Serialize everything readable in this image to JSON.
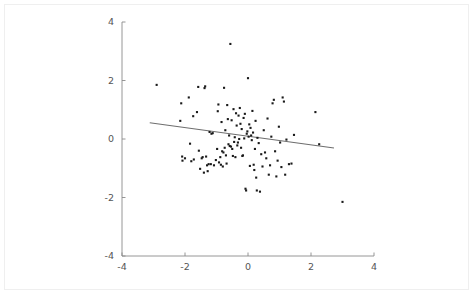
{
  "chart_data": {
    "type": "scatter",
    "title": "",
    "subtitle": "",
    "xlabel": "",
    "ylabel": "",
    "xlim": [
      -4,
      4
    ],
    "ylim": [
      -4,
      4
    ],
    "xticks": [
      -4,
      -2,
      0,
      2,
      4
    ],
    "yticks": [
      -4,
      -2,
      0,
      2,
      4
    ],
    "xtick_labels": [
      "-4",
      "-2",
      "0",
      "2",
      "4"
    ],
    "ytick_labels": [
      "-4",
      "-2",
      "0",
      "2",
      "4"
    ],
    "grid": false,
    "legend": null,
    "legend_position": "none",
    "marker": "square",
    "marker_size": 2.1,
    "point_color": "#1a1a1a",
    "line_color": "#6e6e6e",
    "axis_color": "#8a8a8a",
    "background_color": "#ffffff",
    "border_color": "#efefef",
    "annotations": [],
    "trendline": {
      "type": "linear-fit",
      "slope": -0.147,
      "intercept": 0.095,
      "x_start": -3.12,
      "y_start": 0.553,
      "x_end": 2.73,
      "y_end": -0.306
    },
    "n_points": 122,
    "points": [
      [
        -2.9,
        1.85
      ],
      [
        -2.12,
        1.22
      ],
      [
        -2.15,
        0.62
      ],
      [
        -2.09,
        -0.6
      ],
      [
        -2.08,
        -0.74
      ],
      [
        -2.0,
        -0.66
      ],
      [
        -1.88,
        1.42
      ],
      [
        -1.84,
        -0.16
      ],
      [
        -1.8,
        -0.76
      ],
      [
        -1.74,
        0.78
      ],
      [
        -1.72,
        -0.7
      ],
      [
        -1.62,
        0.92
      ],
      [
        -1.58,
        1.78
      ],
      [
        -1.56,
        -0.4
      ],
      [
        -1.52,
        -1.02
      ],
      [
        -1.47,
        -0.66
      ],
      [
        -1.44,
        -0.62
      ],
      [
        -1.4,
        -1.15
      ],
      [
        -1.38,
        1.74
      ],
      [
        -1.36,
        1.8
      ],
      [
        -1.33,
        -0.6
      ],
      [
        -1.3,
        -0.9
      ],
      [
        -1.28,
        -1.1
      ],
      [
        -1.25,
        -0.86
      ],
      [
        -1.22,
        0.24
      ],
      [
        -1.18,
        -0.86
      ],
      [
        -1.16,
        0.18
      ],
      [
        -1.12,
        0.2
      ],
      [
        -1.08,
        -0.9
      ],
      [
        -1.02,
        -0.72
      ],
      [
        -0.98,
        -0.34
      ],
      [
        -0.96,
        0.95
      ],
      [
        -0.94,
        1.18
      ],
      [
        -0.92,
        -0.8
      ],
      [
        -0.88,
        -0.62
      ],
      [
        -0.86,
        -0.88
      ],
      [
        -0.84,
        0.58
      ],
      [
        -0.82,
        -0.42
      ],
      [
        -0.8,
        -0.94
      ],
      [
        -0.78,
        -0.46
      ],
      [
        -0.76,
        1.75
      ],
      [
        -0.74,
        -0.3
      ],
      [
        -0.72,
        0.3
      ],
      [
        -0.7,
        -0.56
      ],
      [
        -0.68,
        -0.84
      ],
      [
        -0.66,
        1.16
      ],
      [
        -0.64,
        0.68
      ],
      [
        -0.62,
        -0.18
      ],
      [
        -0.6,
        0.12
      ],
      [
        -0.58,
        -0.24
      ],
      [
        -0.56,
        3.25
      ],
      [
        -0.54,
        -0.26
      ],
      [
        -0.52,
        0.64
      ],
      [
        -0.5,
        -0.34
      ],
      [
        -0.48,
        -0.58
      ],
      [
        -0.46,
        1.02
      ],
      [
        -0.44,
        -0.1
      ],
      [
        -0.42,
        0.06
      ],
      [
        -0.4,
        -0.62
      ],
      [
        -0.38,
        0.88
      ],
      [
        -0.36,
        0.46
      ],
      [
        -0.34,
        -0.22
      ],
      [
        -0.32,
        -0.12
      ],
      [
        -0.3,
        0.8
      ],
      [
        -0.28,
        0.0
      ],
      [
        -0.26,
        1.06
      ],
      [
        -0.24,
        0.52
      ],
      [
        -0.22,
        -0.3
      ],
      [
        -0.2,
        0.34
      ],
      [
        -0.18,
        -0.58
      ],
      [
        -0.16,
        -0.56
      ],
      [
        -0.14,
        0.72
      ],
      [
        -0.12,
        0.02
      ],
      [
        -0.1,
        0.86
      ],
      [
        -0.08,
        -1.7
      ],
      [
        -0.06,
        -1.76
      ],
      [
        -0.04,
        0.18
      ],
      [
        -0.02,
        0.26
      ],
      [
        0.0,
        2.08
      ],
      [
        0.02,
        0.08
      ],
      [
        0.04,
        0.5
      ],
      [
        0.06,
        -0.92
      ],
      [
        0.08,
        0.38
      ],
      [
        0.1,
        0.12
      ],
      [
        0.12,
        -0.04
      ],
      [
        0.14,
        0.96
      ],
      [
        0.16,
        0.22
      ],
      [
        0.18,
        -0.88
      ],
      [
        0.2,
        -1.06
      ],
      [
        0.22,
        -0.34
      ],
      [
        0.24,
        0.62
      ],
      [
        0.26,
        -1.32
      ],
      [
        0.28,
        -1.76
      ],
      [
        0.3,
        0.04
      ],
      [
        0.34,
        -0.14
      ],
      [
        0.38,
        -1.8
      ],
      [
        0.42,
        -0.52
      ],
      [
        0.46,
        -0.94
      ],
      [
        0.5,
        0.3
      ],
      [
        0.54,
        -0.46
      ],
      [
        0.58,
        -0.66
      ],
      [
        0.62,
        0.7
      ],
      [
        0.66,
        -1.22
      ],
      [
        0.7,
        -0.9
      ],
      [
        0.74,
        0.08
      ],
      [
        0.78,
        1.22
      ],
      [
        0.82,
        1.34
      ],
      [
        0.86,
        -0.42
      ],
      [
        0.9,
        -1.28
      ],
      [
        0.94,
        -0.74
      ],
      [
        0.98,
        0.42
      ],
      [
        1.02,
        -0.12
      ],
      [
        1.06,
        -0.96
      ],
      [
        1.1,
        1.42
      ],
      [
        1.14,
        1.28
      ],
      [
        1.18,
        -1.22
      ],
      [
        1.22,
        -0.02
      ],
      [
        1.3,
        -0.86
      ],
      [
        1.38,
        -0.84
      ],
      [
        1.46,
        0.14
      ],
      [
        2.14,
        0.92
      ],
      [
        2.26,
        -0.18
      ],
      [
        3.0,
        -2.15
      ]
    ]
  }
}
